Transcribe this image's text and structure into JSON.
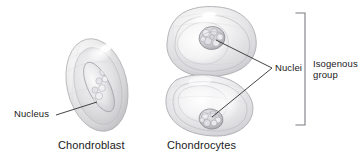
{
  "figure": {
    "background_color": "#ffffff",
    "text_color": "#1a1a1a",
    "line_color": "#3a3a3a",
    "width": 358,
    "height": 165
  },
  "labels": {
    "nucleus": "Nucleus",
    "nuclei": "Nuclei",
    "isogenous_group": "Isogenous group"
  },
  "captions": {
    "chondroblast": "Chondroblast",
    "chondrocytes": "Chondrocytes"
  },
  "structures": {
    "chondroblast_cell": "chondroblast-cell",
    "chondroblast_nucleus": "chondroblast-nucleus",
    "chondrocyte_upper": "chondrocyte-upper-cell",
    "chondrocyte_lower": "chondrocyte-lower-cell",
    "chondrocyte_upper_nucleus": "chondrocyte-upper-nucleus",
    "chondrocyte_lower_nucleus": "chondrocyte-lower-nucleus",
    "bracket": "isogenous-group-bracket"
  }
}
